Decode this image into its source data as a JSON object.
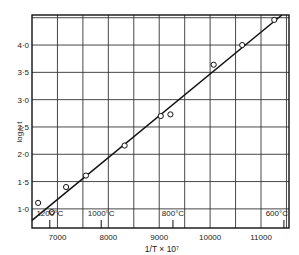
{
  "chart_data": {
    "type": "scatter",
    "title": "",
    "xlabel": "1/T × 10⁷",
    "ylabel": "log₁₀ t",
    "xlim": [
      6500,
      11550
    ],
    "ylim": [
      0.65,
      4.55
    ],
    "grid": true,
    "x_grid_step": 500,
    "y_grid_step": 0.5,
    "x_ticks": [
      7000,
      8000,
      9000,
      10000,
      11000
    ],
    "x_tick_labels": [
      "7000",
      "8000",
      "9000",
      "10000",
      "11000"
    ],
    "y_ticks": [
      1.0,
      1.5,
      2.0,
      2.5,
      3.0,
      3.5,
      4.0
    ],
    "y_tick_labels": [
      "1·0",
      "1·5",
      "2·0",
      "2·5",
      "3·0",
      "3·5",
      "4·0"
    ],
    "series": [
      {
        "name": "measured",
        "marker": "open-circle",
        "points": [
          {
            "x": 6620,
            "y": 1.11
          },
          {
            "x": 6890,
            "y": 0.94
          },
          {
            "x": 7170,
            "y": 1.4
          },
          {
            "x": 7560,
            "y": 1.61
          },
          {
            "x": 8320,
            "y": 2.16
          },
          {
            "x": 9030,
            "y": 2.7
          },
          {
            "x": 9220,
            "y": 2.73
          },
          {
            "x": 10070,
            "y": 3.64
          },
          {
            "x": 10630,
            "y": 4.0
          },
          {
            "x": 11260,
            "y": 4.46
          }
        ]
      },
      {
        "name": "fit",
        "type": "line",
        "points": [
          {
            "x": 6500,
            "y": 0.79
          },
          {
            "x": 11410,
            "y": 4.55
          }
        ]
      }
    ],
    "annotations": [
      {
        "text": "1200°C",
        "x": 6850,
        "tick_x": 6850
      },
      {
        "text": "1000°C",
        "x": 7860,
        "tick_x": 7860
      },
      {
        "text": "800°C",
        "x": 9270,
        "tick_x": 9270
      },
      {
        "text": "600°C",
        "x": 11450,
        "tick_x": 11450
      }
    ]
  }
}
